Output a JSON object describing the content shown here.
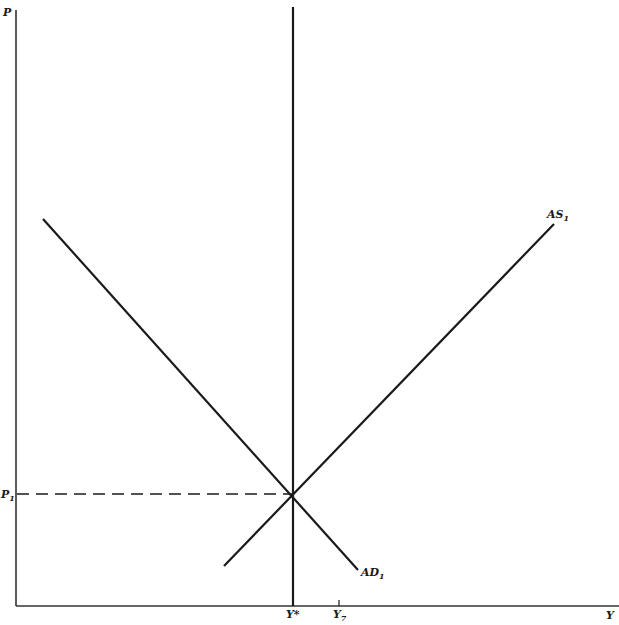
{
  "diagram": {
    "type": "AD-AS economic diagram",
    "axes": {
      "y_axis_label": "P",
      "x_axis_label": "Y"
    },
    "curves": [
      {
        "name": "AD",
        "label": "AD",
        "subscript": "1",
        "description": "Aggregate demand, downward sloping"
      },
      {
        "name": "AS",
        "label": "AS",
        "subscript": "1",
        "description": "Aggregate supply, upward sloping"
      },
      {
        "name": "LRAS",
        "label": "Y*",
        "description": "Vertical line at potential output"
      }
    ],
    "price_levels": [
      {
        "label": "P",
        "subscript": "1"
      }
    ],
    "output_levels": [
      {
        "label": "Y*"
      },
      {
        "label": "Y",
        "subscript": "7"
      }
    ],
    "colors": {
      "line": "#1a1a1a",
      "background": "#ffffff"
    }
  }
}
